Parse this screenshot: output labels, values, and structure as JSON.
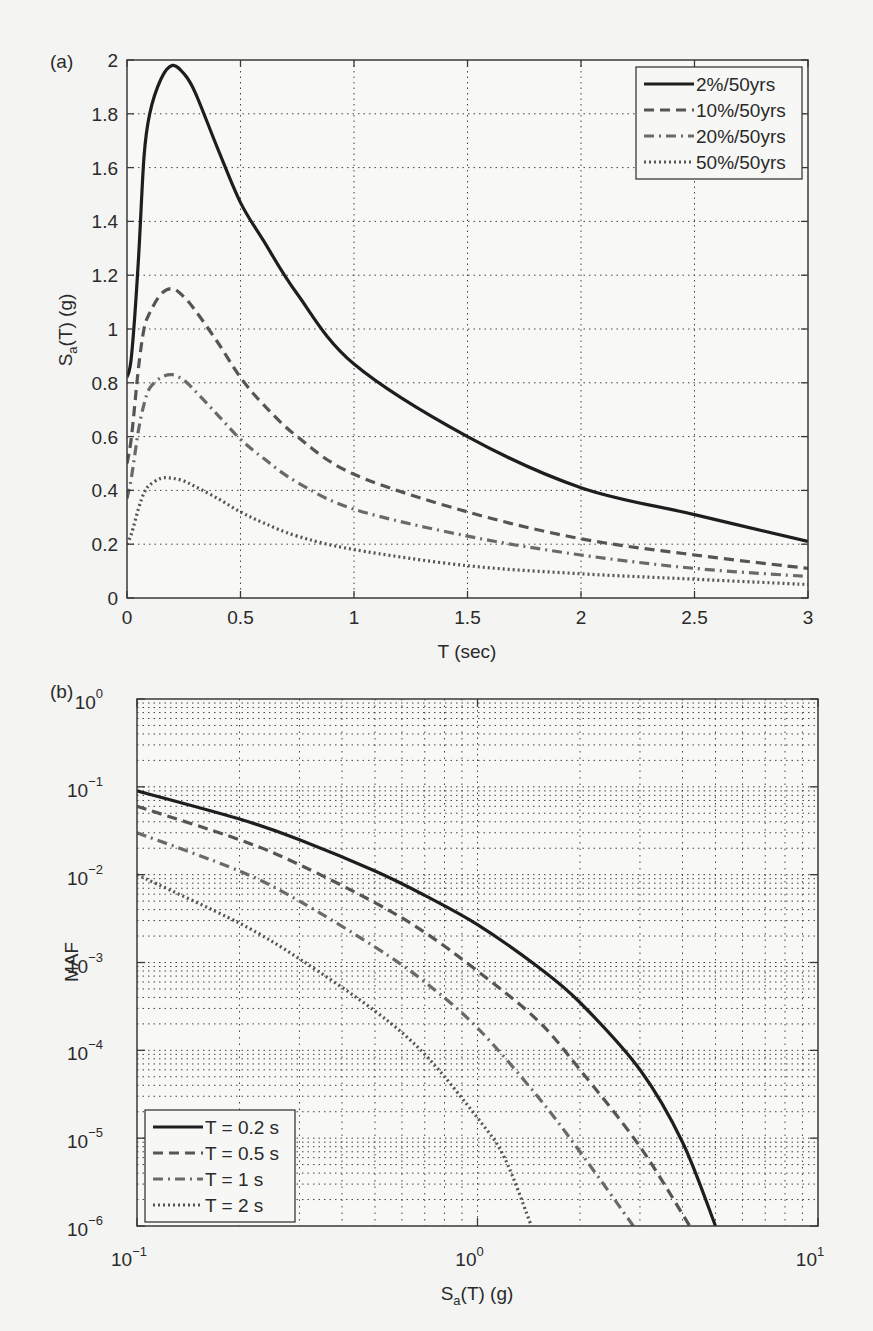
{
  "figure": {
    "panel_a_label": "(a)",
    "panel_b_label": "(b)"
  },
  "chart_data": [
    {
      "id": "a",
      "type": "line",
      "title": "",
      "xlabel": "T (sec)",
      "ylabel": "Sa(T) (g)",
      "ylabel_main": "S",
      "ylabel_sub": "a",
      "ylabel_rest": "(T) (g)",
      "xlim": [
        0,
        3
      ],
      "ylim": [
        0,
        2
      ],
      "xticks": [
        "0",
        "0.5",
        "1",
        "1.5",
        "2",
        "2.5",
        "3"
      ],
      "xtick_values": [
        0,
        0.5,
        1,
        1.5,
        2,
        2.5,
        3
      ],
      "yticks": [
        "0",
        "0.2",
        "0.4",
        "0.6",
        "0.8",
        "1",
        "1.2",
        "1.4",
        "1.6",
        "1.8",
        "2"
      ],
      "ytick_values": [
        0,
        0.2,
        0.4,
        0.6,
        0.8,
        1.0,
        1.2,
        1.4,
        1.6,
        1.8,
        2.0
      ],
      "grid": true,
      "legend_position": "upper right",
      "series": [
        {
          "name": "2%/50yrs",
          "style": "solid",
          "color": "#1e1e1e",
          "x": [
            0,
            0.02,
            0.05,
            0.075,
            0.1,
            0.15,
            0.2,
            0.25,
            0.3,
            0.4,
            0.5,
            0.6,
            0.75,
            1.0,
            1.5,
            2.0,
            2.5,
            3.0
          ],
          "y": [
            0.82,
            0.9,
            1.25,
            1.64,
            1.8,
            1.93,
            1.98,
            1.95,
            1.88,
            1.67,
            1.47,
            1.33,
            1.13,
            0.87,
            0.6,
            0.41,
            0.31,
            0.21
          ]
        },
        {
          "name": "10%/50yrs",
          "style": "dashed",
          "color": "#555555",
          "x": [
            0,
            0.02,
            0.05,
            0.075,
            0.1,
            0.15,
            0.2,
            0.25,
            0.3,
            0.4,
            0.5,
            0.6,
            0.75,
            1.0,
            1.5,
            2.0,
            2.5,
            3.0
          ],
          "y": [
            0.5,
            0.6,
            0.85,
            1.0,
            1.06,
            1.13,
            1.15,
            1.12,
            1.07,
            0.95,
            0.82,
            0.72,
            0.6,
            0.46,
            0.32,
            0.22,
            0.16,
            0.11
          ]
        },
        {
          "name": "20%/50yrs",
          "style": "dashdot",
          "color": "#6a6a6a",
          "x": [
            0,
            0.02,
            0.05,
            0.075,
            0.1,
            0.15,
            0.2,
            0.25,
            0.3,
            0.4,
            0.5,
            0.6,
            0.75,
            1.0,
            1.5,
            2.0,
            2.5,
            3.0
          ],
          "y": [
            0.37,
            0.45,
            0.62,
            0.72,
            0.78,
            0.82,
            0.83,
            0.81,
            0.77,
            0.68,
            0.59,
            0.52,
            0.43,
            0.33,
            0.23,
            0.16,
            0.11,
            0.08
          ]
        },
        {
          "name": "50%/50yrs",
          "style": "dotted",
          "color": "#555555",
          "x": [
            0,
            0.02,
            0.05,
            0.075,
            0.1,
            0.15,
            0.2,
            0.25,
            0.3,
            0.4,
            0.5,
            0.6,
            0.75,
            1.0,
            1.5,
            2.0,
            2.5,
            3.0
          ],
          "y": [
            0.2,
            0.24,
            0.33,
            0.39,
            0.42,
            0.445,
            0.445,
            0.435,
            0.415,
            0.37,
            0.32,
            0.28,
            0.23,
            0.18,
            0.12,
            0.09,
            0.07,
            0.05
          ]
        }
      ]
    },
    {
      "id": "b",
      "type": "line",
      "title": "",
      "xlabel": "Sa(T) (g)",
      "xlabel_main": "S",
      "xlabel_sub": "a",
      "xlabel_rest": "(T) (g)",
      "ylabel": "MAF",
      "xscale": "log",
      "yscale": "log",
      "xlim": [
        0.1,
        10
      ],
      "ylim": [
        1e-06,
        1
      ],
      "xticks": [
        {
          "base": "10",
          "exp": "−1"
        },
        {
          "base": "10",
          "exp": "0"
        },
        {
          "base": "10",
          "exp": "1"
        }
      ],
      "xtick_values": [
        0.1,
        1,
        10
      ],
      "yticks": [
        {
          "base": "10",
          "exp": "−6"
        },
        {
          "base": "10",
          "exp": "−5"
        },
        {
          "base": "10",
          "exp": "−4"
        },
        {
          "base": "10",
          "exp": "−3"
        },
        {
          "base": "10",
          "exp": "−2"
        },
        {
          "base": "10",
          "exp": "−1"
        },
        {
          "base": "10",
          "exp": "0"
        }
      ],
      "ytick_values": [
        1e-06,
        1e-05,
        0.0001,
        0.001,
        0.01,
        0.1,
        1
      ],
      "grid": true,
      "minor_grid": true,
      "legend_position": "lower left",
      "series": [
        {
          "name": "T = 0.2 s",
          "style": "solid",
          "color": "#1e1e1e",
          "x": [
            0.1,
            0.2,
            0.3,
            0.5,
            0.7,
            1.0,
            1.5,
            2.0,
            3.0,
            4.0,
            5.0
          ],
          "y": [
            0.09,
            0.043,
            0.025,
            0.011,
            0.0058,
            0.0027,
            0.0009,
            0.00035,
            6e-05,
            9e-06,
            1e-06
          ]
        },
        {
          "name": "T = 0.5 s",
          "style": "dashed",
          "color": "#555555",
          "x": [
            0.1,
            0.2,
            0.3,
            0.5,
            0.7,
            1.0,
            1.5,
            2.0,
            3.0,
            4.2
          ],
          "y": [
            0.06,
            0.025,
            0.013,
            0.0048,
            0.0022,
            0.0008,
            0.00022,
            6e-05,
            8e-06,
            1e-06
          ]
        },
        {
          "name": "T = 1 s",
          "style": "dashdot",
          "color": "#6a6a6a",
          "x": [
            0.1,
            0.2,
            0.3,
            0.5,
            0.7,
            1.0,
            1.5,
            2.0,
            2.87
          ],
          "y": [
            0.03,
            0.011,
            0.005,
            0.0015,
            0.0006,
            0.00018,
            3e-05,
            7e-06,
            1e-06
          ]
        },
        {
          "name": "T = 2 s",
          "style": "dotted",
          "color": "#555555",
          "x": [
            0.1,
            0.2,
            0.3,
            0.5,
            0.7,
            1.0,
            1.2,
            1.44
          ],
          "y": [
            0.01,
            0.0028,
            0.0011,
            0.00028,
            9e-05,
            1.7e-05,
            6e-06,
            1e-06
          ]
        }
      ]
    }
  ]
}
